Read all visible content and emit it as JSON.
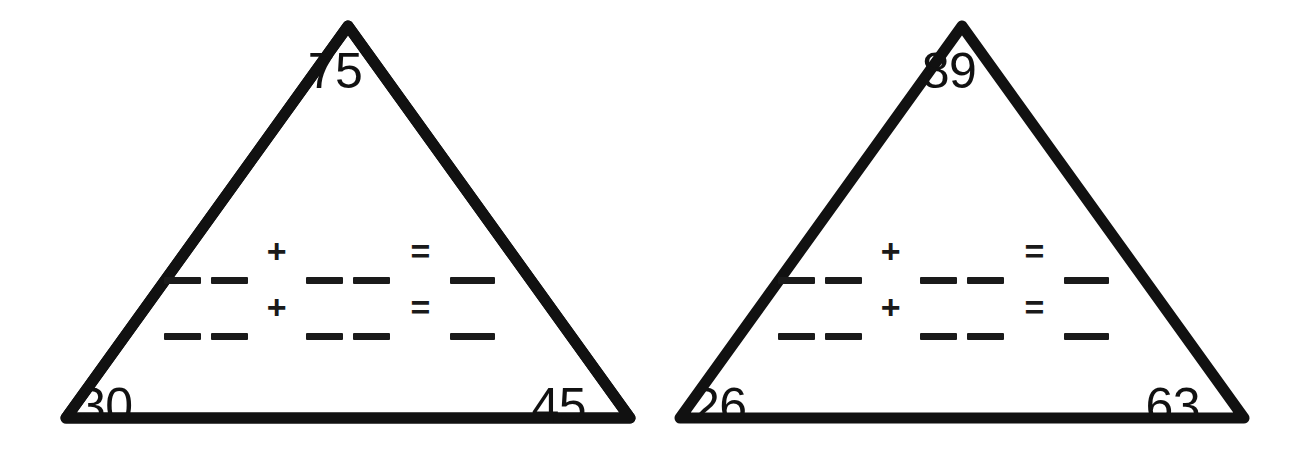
{
  "worksheet": {
    "title": "Number triangle fact family worksheet",
    "background_color": "#ffffff",
    "stroke_color": "#111111"
  },
  "triangles": [
    {
      "name": "triangle-left",
      "top_number": "75",
      "bottom_left_number": "30",
      "bottom_right_number": "45",
      "equations": [
        {
          "plus": "+",
          "equals": "="
        },
        {
          "plus": "+",
          "equals": "="
        }
      ]
    },
    {
      "name": "triangle-right",
      "top_number": "89",
      "bottom_left_number": "26",
      "bottom_right_number": "63",
      "equations": [
        {
          "plus": "+",
          "equals": "="
        },
        {
          "plus": "+",
          "equals": "="
        }
      ]
    }
  ]
}
